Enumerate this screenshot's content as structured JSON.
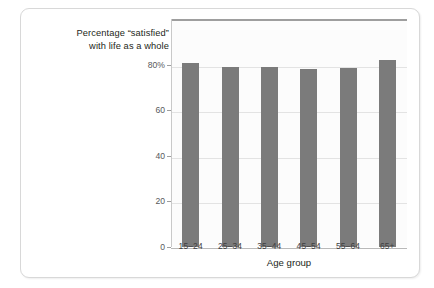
{
  "chart_data": {
    "type": "bar",
    "title": "Percentage “satisfied” with life as a whole",
    "title_lines": [
      "Percentage “satisfied”",
      "with life as a whole"
    ],
    "xlabel": "Age group",
    "ylabel": "",
    "categories": [
      "15–24",
      "25–34",
      "35–44",
      "45–54",
      "55–64",
      "65+"
    ],
    "values": [
      80.5,
      79.0,
      78.8,
      78.0,
      78.4,
      82.0
    ],
    "ylim": [
      0,
      100
    ],
    "y_ticks": [
      0,
      20,
      40,
      60,
      80
    ],
    "y_tick_labels": [
      "0",
      "20",
      "40",
      "60",
      "80%"
    ],
    "grid": true,
    "legend": "none",
    "bar_color": "#7b7b7b",
    "plot_background": "#fcfcfc",
    "gridline_color": "#e3e3e3",
    "axis_color": "#9e9e9e",
    "text_color": "#231f20"
  }
}
